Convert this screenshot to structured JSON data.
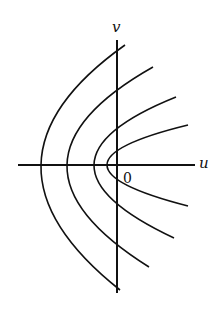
{
  "diagram": {
    "type": "coordinate-plane-curves",
    "axes": {
      "horizontal_label": "u",
      "vertical_label": "v",
      "origin_label": "0"
    },
    "curves": [
      {
        "name": "parabola-1",
        "vertex_x": 41
      },
      {
        "name": "parabola-2",
        "vertex_x": 67
      },
      {
        "name": "parabola-3",
        "vertex_x": 94
      },
      {
        "name": "parabola-4",
        "vertex_x": 107
      }
    ],
    "colors": {
      "stroke": "#111111",
      "background": "#ffffff"
    }
  }
}
